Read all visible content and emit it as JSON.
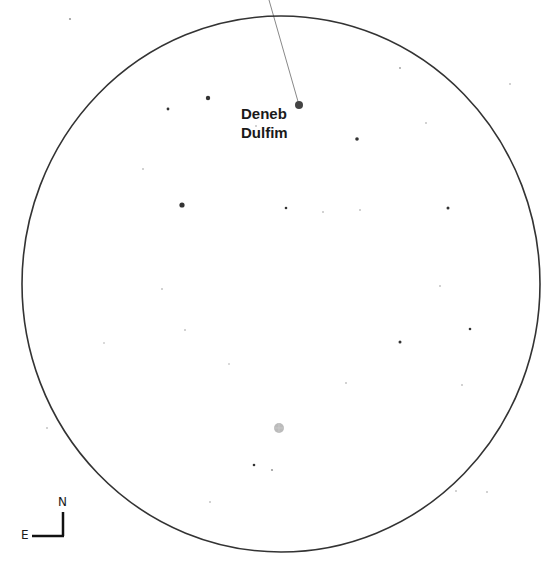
{
  "field_of_view": {
    "cx": 281,
    "cy": 284,
    "rx": 259,
    "ry": 268,
    "stroke": "#333333"
  },
  "target": {
    "label_line1": "Deneb",
    "label_line2": "Dulfim",
    "x": 299,
    "y": 105,
    "r": 4,
    "color": "#444444",
    "pointer_from": [
      269,
      0
    ],
    "label_x": 241,
    "label_y": 104
  },
  "marker": {
    "x": 279,
    "y": 428,
    "r": 5,
    "color": "#aaaaaa"
  },
  "stars": [
    {
      "x": 208,
      "y": 98,
      "r": 2.2
    },
    {
      "x": 168,
      "y": 109,
      "r": 1.4
    },
    {
      "x": 182,
      "y": 205,
      "r": 2.6
    },
    {
      "x": 357,
      "y": 139,
      "r": 1.8
    },
    {
      "x": 286,
      "y": 208,
      "r": 1.3
    },
    {
      "x": 448,
      "y": 208,
      "r": 1.5
    },
    {
      "x": 400,
      "y": 342,
      "r": 1.5
    },
    {
      "x": 470,
      "y": 329,
      "r": 1.3
    },
    {
      "x": 254,
      "y": 465,
      "r": 1.3
    },
    {
      "x": 272,
      "y": 470,
      "r": 1.1
    },
    {
      "x": 70,
      "y": 19,
      "r": 1.1
    },
    {
      "x": 400,
      "y": 68,
      "r": 0.9
    },
    {
      "x": 426,
      "y": 123,
      "r": 0.8
    },
    {
      "x": 323,
      "y": 212,
      "r": 0.8
    },
    {
      "x": 360,
      "y": 210,
      "r": 0.8
    },
    {
      "x": 256,
      "y": 126,
      "r": 0.8
    },
    {
      "x": 143,
      "y": 169,
      "r": 0.8
    },
    {
      "x": 162,
      "y": 289,
      "r": 0.8
    },
    {
      "x": 185,
      "y": 330,
      "r": 0.8
    },
    {
      "x": 440,
      "y": 286,
      "r": 0.8
    },
    {
      "x": 462,
      "y": 385,
      "r": 0.8
    },
    {
      "x": 456,
      "y": 491,
      "r": 0.8
    },
    {
      "x": 487,
      "y": 492,
      "r": 0.8
    },
    {
      "x": 346,
      "y": 383,
      "r": 0.8
    },
    {
      "x": 210,
      "y": 502,
      "r": 0.8
    },
    {
      "x": 47,
      "y": 428,
      "r": 0.8
    },
    {
      "x": 104,
      "y": 343,
      "r": 0.7
    },
    {
      "x": 229,
      "y": 364,
      "r": 0.7
    },
    {
      "x": 510,
      "y": 84,
      "r": 0.8
    }
  ],
  "compass": {
    "north_label": "N",
    "east_label": "E",
    "corner_x": 63,
    "corner_y": 536,
    "north_len": 24,
    "east_len": 31
  }
}
